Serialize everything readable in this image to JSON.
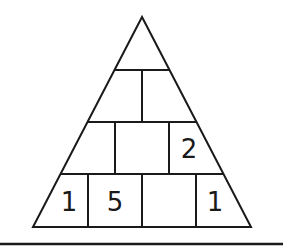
{
  "puzzle": {
    "type": "number-pyramid",
    "rows": [
      {
        "cells": [
          ""
        ]
      },
      {
        "cells": [
          "",
          ""
        ]
      },
      {
        "cells": [
          "",
          "",
          "2"
        ]
      },
      {
        "cells": [
          "1",
          "5",
          "",
          "1"
        ]
      }
    ]
  },
  "colors": {
    "line": "#1a1a1a",
    "background": "#ffffff"
  }
}
